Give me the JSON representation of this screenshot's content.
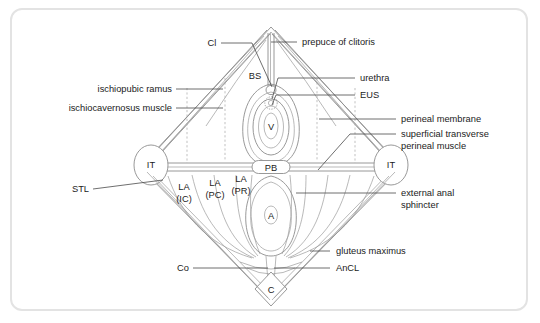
{
  "figure": {
    "frame_border_color": "#e3e3e3",
    "background_color": "#ffffff",
    "line_color": "#8d8d8d",
    "leader_color": "#4a4a4a",
    "text_color": "#1b1b1b"
  },
  "left_labels": [
    {
      "id": "ischiopubic-ramus",
      "text": "ischiopubic ramus"
    },
    {
      "id": "ischiocavernosus-muscle",
      "text": "ischiocavernosus muscle"
    },
    {
      "id": "stl",
      "text": "STL"
    },
    {
      "id": "co",
      "text": "Co"
    }
  ],
  "right_labels": [
    {
      "id": "prepuce-of-clitoris",
      "text": "prepuce of clitoris"
    },
    {
      "id": "urethra",
      "text": "urethra"
    },
    {
      "id": "eus",
      "text": "EUS"
    },
    {
      "id": "perineal-membrane",
      "text": "perineal membrane"
    },
    {
      "id": "superficial-transverse-perineal-muscle",
      "line1": "superficial transverse",
      "line2": "perineal muscle"
    },
    {
      "id": "external-anal-sphincter",
      "line1": "external anal",
      "line2": "sphincter"
    },
    {
      "id": "gluteus-maximus",
      "text": "gluteus maximus"
    },
    {
      "id": "ancl",
      "text": "AnCL"
    }
  ],
  "inline_labels": [
    {
      "id": "cl",
      "text": "Cl"
    },
    {
      "id": "bs",
      "text": "BS"
    },
    {
      "id": "v",
      "text": "V"
    },
    {
      "id": "pb",
      "text": "PB"
    },
    {
      "id": "a",
      "text": "A"
    },
    {
      "id": "c",
      "text": "C"
    },
    {
      "id": "it-left",
      "text": "IT"
    },
    {
      "id": "it-right",
      "text": "IT"
    },
    {
      "id": "la-ic-line1",
      "text": "LA"
    },
    {
      "id": "la-ic-line2",
      "text": "(IC)"
    },
    {
      "id": "la-pc-line1",
      "text": "LA"
    },
    {
      "id": "la-pc-line2",
      "text": "(PC)"
    },
    {
      "id": "la-pr-line1",
      "text": "LA"
    },
    {
      "id": "la-pr-line2",
      "text": "(PR)"
    }
  ]
}
